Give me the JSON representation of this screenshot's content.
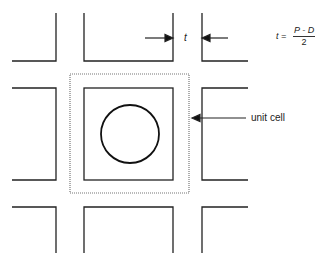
{
  "diagram": {
    "labels": {
      "thickness_symbol": "t",
      "unit_cell": "unit cell"
    },
    "formula": {
      "lhs": "t =",
      "numerator": "P - D",
      "denominator": "2"
    },
    "elements": {
      "grid": "3x3 array of square tiles separated by gaps of width t",
      "center_tile_contains": "circle",
      "unit_cell_border": "dotted square around center tile"
    },
    "colors": {
      "line": "#222222",
      "dotted": "#777777",
      "background": "#ffffff"
    }
  }
}
